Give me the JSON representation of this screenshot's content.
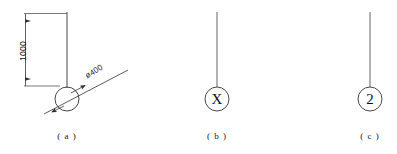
{
  "figure": {
    "type": "engineering-line-drawing",
    "background_color": "#ffffff",
    "line_color": "#333333",
    "text_color": "#1a1a1a",
    "subfigures": [
      {
        "id": "a",
        "caption": "( a )",
        "symbol_text": "",
        "dimension_label": "1000",
        "leader_label": "ø400",
        "description": "pole with circle, vertical dimension and diameter leader"
      },
      {
        "id": "b",
        "caption": "( b )",
        "symbol_text": "X",
        "description": "pole with circle containing X"
      },
      {
        "id": "c",
        "caption": "( c )",
        "symbol_text": "2",
        "description": "pole with circle containing 2"
      }
    ]
  }
}
